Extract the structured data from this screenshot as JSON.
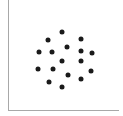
{
  "chart_data": {
    "type": "scatter",
    "title": "",
    "xlabel": "",
    "ylabel": "",
    "grid": false,
    "legend": null,
    "marker_color": "#1a1a1a",
    "axis_color": "#a8a8a8",
    "points": [
      {
        "x": 62,
        "y": 32
      },
      {
        "x": 48,
        "y": 40
      },
      {
        "x": 81,
        "y": 39
      },
      {
        "x": 67,
        "y": 47
      },
      {
        "x": 39,
        "y": 52
      },
      {
        "x": 52,
        "y": 52
      },
      {
        "x": 81,
        "y": 51
      },
      {
        "x": 92,
        "y": 53
      },
      {
        "x": 62,
        "y": 61
      },
      {
        "x": 81,
        "y": 61
      },
      {
        "x": 38,
        "y": 69
      },
      {
        "x": 53,
        "y": 69
      },
      {
        "x": 91,
        "y": 71
      },
      {
        "x": 68,
        "y": 75
      },
      {
        "x": 81,
        "y": 79
      },
      {
        "x": 49,
        "y": 82
      },
      {
        "x": 62,
        "y": 87
      }
    ]
  }
}
